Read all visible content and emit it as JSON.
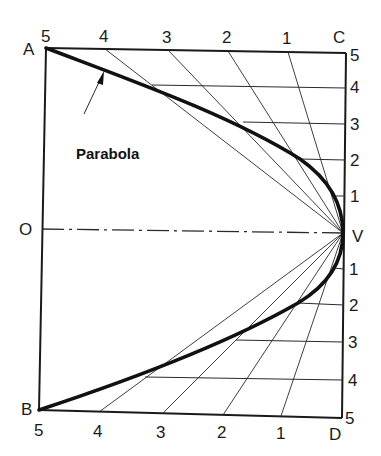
{
  "figure": {
    "caption_label": "Parabola",
    "points": {
      "A": {
        "label": "A",
        "x": 46,
        "y": 48
      },
      "B": {
        "label": "B",
        "x": 39,
        "y": 410
      },
      "C": {
        "label": "C",
        "x": 346,
        "y": 53
      },
      "D": {
        "label": "D",
        "x": 342,
        "y": 418
      },
      "O": {
        "label": "O",
        "x": 42,
        "y": 229
      },
      "V": {
        "label": "V",
        "x": 343,
        "y": 233
      }
    },
    "top_ticks": [
      {
        "label": "5",
        "x": 46
      },
      {
        "label": "4",
        "x": 105
      },
      {
        "label": "3",
        "x": 168
      },
      {
        "label": "2",
        "x": 228
      },
      {
        "label": "1",
        "x": 288
      }
    ],
    "bottom_ticks": [
      {
        "label": "5",
        "x": 40
      },
      {
        "label": "4",
        "x": 99
      },
      {
        "label": "3",
        "x": 162
      },
      {
        "label": "2",
        "x": 223
      },
      {
        "label": "1",
        "x": 281
      }
    ],
    "right_ticks_upper": [
      {
        "label": "5",
        "y": 55
      },
      {
        "label": "4",
        "y": 87
      },
      {
        "label": "3",
        "y": 124
      },
      {
        "label": "2",
        "y": 160
      },
      {
        "label": "1",
        "y": 196
      }
    ],
    "right_ticks_lower": [
      {
        "label": "1",
        "y": 269
      },
      {
        "label": "2",
        "y": 305
      },
      {
        "label": "3",
        "y": 342
      },
      {
        "label": "4",
        "y": 380
      },
      {
        "label": "5",
        "y": 416
      }
    ],
    "colors": {
      "ink": "#1a1a1a",
      "thin_line": "#2a2a2a",
      "background": "#ffffff"
    },
    "axis_style": "dash-dot",
    "parabola_stroke_width": 3.6
  }
}
